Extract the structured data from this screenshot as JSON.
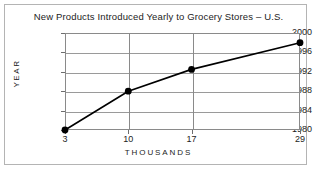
{
  "chart_data": {
    "type": "line",
    "title": "New Products Introduced Yearly to Grocery Stores – U.S.",
    "xlabel": "THOUSANDS",
    "ylabel": "YEAR",
    "x": [
      3,
      10,
      17,
      29
    ],
    "values": [
      1980,
      1988,
      1992.5,
      1998
    ],
    "series": [
      {
        "name": "New products introduced",
        "x": [
          3,
          10,
          17,
          29
        ],
        "values": [
          1980,
          1988,
          1992.5,
          1998
        ]
      }
    ],
    "xtick_labels": [
      "3",
      "10",
      "17",
      "29"
    ],
    "xtick_values": [
      3,
      10,
      17,
      29
    ],
    "ytick_labels": [
      "1980",
      "1984",
      "1988",
      "1992",
      "1996",
      "2000"
    ],
    "ytick_values": [
      1980,
      1984,
      1988,
      1992,
      1996,
      2000
    ],
    "xlim": [
      3,
      29
    ],
    "ylim": [
      1980,
      2000
    ],
    "grid": "both",
    "legend": "none",
    "marker": "filled-circle",
    "line_color": "#000000",
    "grid_color": "#9a9a9a",
    "axis_color": "#8a8a8a",
    "text_color": "#1c1c1c",
    "frame_color": "#b4b4b4",
    "background": "#ffffff"
  }
}
